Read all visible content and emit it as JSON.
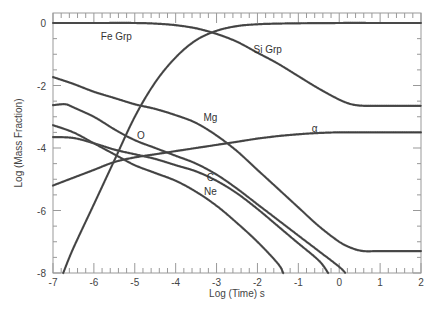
{
  "chart_data": {
    "type": "line",
    "title": "",
    "xlabel": "Log (Time) s",
    "ylabel": "Log (Mass Fraction)",
    "xlim": [
      -7,
      2
    ],
    "ylim": [
      -8,
      0.3
    ],
    "xticks": [
      -7,
      -6,
      -5,
      -4,
      -3,
      -2,
      -1,
      0,
      1,
      2
    ],
    "yticks": [
      0,
      -2,
      -4,
      -6,
      -8
    ],
    "grid": false,
    "legend": "inline labels",
    "series": [
      {
        "name": "Fe Grp",
        "label_pos": [
          -5.45,
          -0.55
        ],
        "x": [
          -6.75,
          -6.5,
          -6.0,
          -5.5,
          -5.0,
          -4.5,
          -4.0,
          -3.5,
          -3.0,
          -2.5,
          -2.0,
          -1.5,
          -1.0,
          0,
          1,
          2
        ],
        "y": [
          -8.0,
          -7.2,
          -5.8,
          -4.4,
          -3.0,
          -1.9,
          -1.1,
          -0.55,
          -0.25,
          -0.1,
          -0.04,
          -0.02,
          -0.01,
          0,
          0,
          0
        ]
      },
      {
        "name": "Si Grp",
        "label_pos": [
          -1.75,
          -0.95
        ],
        "x": [
          -7,
          -6,
          -5,
          -4.5,
          -4.0,
          -3.5,
          -3.0,
          -2.5,
          -2.0,
          -1.5,
          -1.0,
          -0.5,
          0,
          0.3,
          0.6,
          1,
          2
        ],
        "y": [
          0,
          0,
          0,
          -0.02,
          -0.07,
          -0.17,
          -0.35,
          -0.6,
          -0.95,
          -1.3,
          -1.7,
          -2.1,
          -2.45,
          -2.6,
          -2.65,
          -2.65,
          -2.65
        ]
      },
      {
        "name": "Mg",
        "label_pos": [
          -3.15,
          -3.15
        ],
        "x": [
          -7,
          -6.5,
          -6.0,
          -5.5,
          -5.0,
          -4.5,
          -4.0,
          -3.5,
          -3.0,
          -2.5,
          -2.0,
          -1.5,
          -1.0,
          -0.5,
          0,
          0.3,
          0.6,
          1,
          2
        ],
        "y": [
          -1.73,
          -1.95,
          -2.2,
          -2.4,
          -2.6,
          -2.75,
          -2.95,
          -3.2,
          -3.6,
          -4.1,
          -4.7,
          -5.3,
          -5.9,
          -6.5,
          -7.0,
          -7.2,
          -7.3,
          -7.3,
          -7.3
        ]
      },
      {
        "name": "O",
        "label_pos": [
          -4.85,
          -3.7
        ],
        "x": [
          -7,
          -6.7,
          -6.5,
          -6.0,
          -5.5,
          -5.0,
          -4.5,
          -4.0,
          -3.5,
          -3.0,
          -2.5,
          -2.0,
          -1.5,
          -1.0,
          -0.5,
          0,
          0.15
        ],
        "y": [
          -2.63,
          -2.6,
          -2.7,
          -3.0,
          -3.4,
          -3.75,
          -4.0,
          -4.25,
          -4.5,
          -4.85,
          -5.3,
          -5.8,
          -6.3,
          -6.8,
          -7.3,
          -7.8,
          -8.0
        ]
      },
      {
        "name": "C",
        "label_pos": [
          -3.15,
          -5.05
        ],
        "x": [
          -7,
          -6.5,
          -6.0,
          -5.5,
          -5.0,
          -4.5,
          -4.0,
          -3.5,
          -3.0,
          -2.5,
          -2.0,
          -1.5,
          -1.0,
          -0.5,
          -0.27
        ],
        "y": [
          -3.65,
          -3.68,
          -3.85,
          -4.05,
          -4.2,
          -4.35,
          -4.55,
          -4.75,
          -5.05,
          -5.45,
          -5.95,
          -6.5,
          -7.05,
          -7.6,
          -8.0
        ]
      },
      {
        "name": "Ne",
        "label_pos": [
          -3.15,
          -5.5
        ],
        "x": [
          -7,
          -6.5,
          -6.0,
          -5.5,
          -5.0,
          -4.5,
          -4.0,
          -3.5,
          -3.0,
          -2.5,
          -2.0,
          -1.5,
          -1.37
        ],
        "y": [
          -3.27,
          -3.5,
          -3.85,
          -4.2,
          -4.55,
          -4.8,
          -5.05,
          -5.4,
          -5.85,
          -6.4,
          -7.0,
          -7.7,
          -8.0
        ]
      },
      {
        "name": "α",
        "label_pos": [
          -0.6,
          -3.5
        ],
        "x": [
          -7,
          -6.5,
          -6.0,
          -5.5,
          -5.0,
          -4.5,
          -4.0,
          -3.5,
          -3.0,
          -2.5,
          -2.0,
          -1.5,
          -1.0,
          -0.5,
          0,
          1,
          2
        ],
        "y": [
          -5.2,
          -4.95,
          -4.7,
          -4.45,
          -4.3,
          -4.2,
          -4.1,
          -4.0,
          -3.9,
          -3.8,
          -3.7,
          -3.62,
          -3.56,
          -3.52,
          -3.5,
          -3.5,
          -3.5
        ]
      }
    ]
  },
  "colors": {
    "curve": "#555555",
    "axis": "#999999",
    "text": "#444444"
  }
}
